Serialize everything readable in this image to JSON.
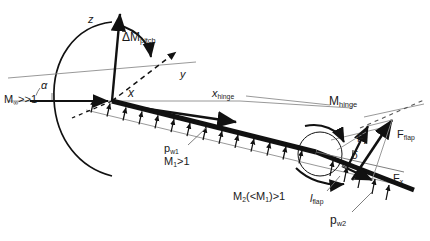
{
  "figure": {
    "kind": "hypersonic-flap-free-body-diagram",
    "background": "#ffffff",
    "line_color": "#111111",
    "thin_color": "#8a8a8a"
  },
  "axes": {
    "z_label": "z",
    "y_label": "y",
    "x_label": "x",
    "origin_note": "body-fixed frame at plate leading edge"
  },
  "labels": {
    "delta_m_pitch": "ΔM",
    "delta_m_pitch_sub": "pitch",
    "alpha": "α",
    "delta": "δ",
    "mach_freestream": "M",
    "mach_freestream_sub": "∞",
    "mach_freestream_rel": ">>1",
    "x_hinge": "x",
    "x_hinge_sub": "hinge",
    "m_hinge": "M",
    "m_hinge_sub": "hinge",
    "p_w1": "p",
    "p_w1_sub": "w1",
    "mach1": "M",
    "mach1_sub": "1",
    "mach1_rel": ">1",
    "mach2_expr": "M",
    "mach2_sub": "2",
    "mach2_rel": "(<M",
    "mach2_rel_sub": "1",
    "mach2_rel_tail": ")>1",
    "l_flap": "l",
    "l_flap_sub": "flap",
    "p_w2": "p",
    "p_w2_sub": "w2",
    "f_flap": "F",
    "f_flap_sub": "flap",
    "f_z": "F",
    "f_z_sub": "z",
    "f_x": "F",
    "f_x_sub": "x"
  },
  "colors": {
    "ink": "#111111",
    "grey_line": "#8d8d8d",
    "label_ink": "#1f1f1f"
  }
}
